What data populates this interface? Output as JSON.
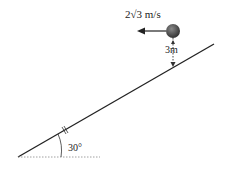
{
  "diagram": {
    "velocity_label": "2√3 m/s",
    "height_label": "3m",
    "angle_label": "30°",
    "colors": {
      "line": "#222222",
      "ball": "#444444"
    }
  }
}
